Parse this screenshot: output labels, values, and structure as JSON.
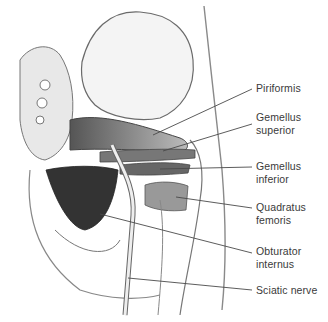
{
  "figure": {
    "type": "anatomical-illustration",
    "line_color": "#4a4a4a",
    "label_color": "#3a3a3a"
  },
  "labels": [
    {
      "id": "piriformis",
      "lines": [
        "Piriformis"
      ],
      "top": 82,
      "leader": {
        "x1": 153,
        "y1": 135,
        "x2": 252,
        "y2": 89
      }
    },
    {
      "id": "gemellus-superior",
      "lines": [
        "Gemellus",
        "superior"
      ],
      "top": 111,
      "leader": {
        "x1": 163,
        "y1": 151,
        "x2": 252,
        "y2": 124
      }
    },
    {
      "id": "gemellus-inferior",
      "lines": [
        "Gemellus",
        "inferior"
      ],
      "top": 160,
      "leader": {
        "x1": 160,
        "y1": 169,
        "x2": 252,
        "y2": 167
      }
    },
    {
      "id": "quadratus-femoris",
      "lines": [
        "Quadratus",
        "femoris"
      ],
      "top": 201,
      "leader": {
        "x1": 176,
        "y1": 197,
        "x2": 252,
        "y2": 208
      }
    },
    {
      "id": "obturator-internus",
      "lines": [
        "Obturator",
        "internus"
      ],
      "top": 245,
      "leader": {
        "x1": 100,
        "y1": 214,
        "x2": 252,
        "y2": 253
      }
    },
    {
      "id": "sciatic-nerve",
      "lines": [
        "Sciatic nerve"
      ],
      "top": 284,
      "leader": {
        "x1": 128,
        "y1": 278,
        "x2": 252,
        "y2": 290
      }
    }
  ]
}
